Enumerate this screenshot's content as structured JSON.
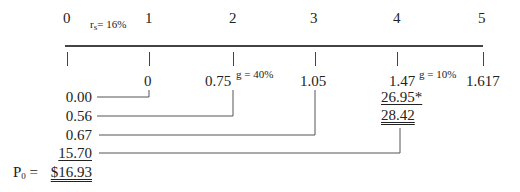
{
  "timeline": {
    "periods": [
      "0",
      "1",
      "2",
      "3",
      "4",
      "5"
    ],
    "required_return": {
      "symbol": "r",
      "subscript": "s",
      "label": "= 16%"
    },
    "cash_flows": [
      "0",
      "0.75",
      "1.05",
      "1.47",
      "1.617"
    ],
    "growth_rates": [
      {
        "label": "g = 40%"
      },
      {
        "label": "g = 10%"
      }
    ],
    "terminal_value": "26.95*",
    "total_year4": "28.42"
  },
  "present_values": {
    "items": [
      "0.00",
      "0.56",
      "0.67",
      "15.70"
    ],
    "price_label": "P",
    "price_subscript": "0",
    "price_eq": " =",
    "price_value": "$16.93"
  }
}
